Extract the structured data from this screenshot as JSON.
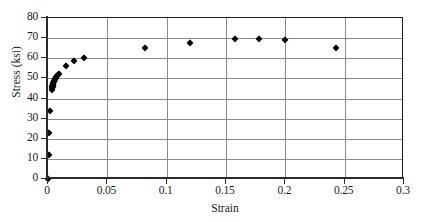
{
  "chart_data": {
    "type": "scatter",
    "title": "",
    "xlabel": "Strain",
    "ylabel": "Stress (ksi)",
    "xlim": [
      0,
      0.3
    ],
    "ylim": [
      0,
      80
    ],
    "grid": true,
    "legend": "none",
    "marker": "diamond",
    "marker_color": "#000000",
    "xticks": [
      "0",
      "0.05",
      "0.1",
      "0.15",
      "0.2",
      "0.25",
      "0.3"
    ],
    "xtick_values": [
      0,
      0.05,
      0.1,
      0.15,
      0.2,
      0.25,
      0.3
    ],
    "yticks": [
      "0",
      "10",
      "20",
      "30",
      "40",
      "50",
      "60",
      "70",
      "80"
    ],
    "ytick_values": [
      0,
      10,
      20,
      30,
      40,
      50,
      60,
      70,
      80
    ],
    "series": [
      {
        "name": "Stress vs Strain",
        "points": [
          [
            0.0,
            0.0
          ],
          [
            0.0006,
            12.0
          ],
          [
            0.001,
            23.0
          ],
          [
            0.0016,
            34.0
          ],
          [
            0.003,
            44.0
          ],
          [
            0.0034,
            45.0
          ],
          [
            0.0036,
            46.0
          ],
          [
            0.0038,
            45.5
          ],
          [
            0.004,
            46.5
          ],
          [
            0.0042,
            47.0
          ],
          [
            0.0044,
            46.0
          ],
          [
            0.0046,
            47.5
          ],
          [
            0.0048,
            48.0
          ],
          [
            0.0052,
            48.5
          ],
          [
            0.0056,
            49.0
          ],
          [
            0.006,
            49.5
          ],
          [
            0.0064,
            50.0
          ],
          [
            0.007,
            50.5
          ],
          [
            0.0076,
            51.0
          ],
          [
            0.0084,
            51.5
          ],
          [
            0.0094,
            52.0
          ],
          [
            0.015,
            56.0
          ],
          [
            0.022,
            58.5
          ],
          [
            0.03,
            60.0
          ],
          [
            0.082,
            65.0
          ],
          [
            0.12,
            67.5
          ],
          [
            0.158,
            69.5
          ],
          [
            0.178,
            69.5
          ],
          [
            0.2,
            69.0
          ],
          [
            0.243,
            65.0
          ]
        ]
      }
    ]
  }
}
